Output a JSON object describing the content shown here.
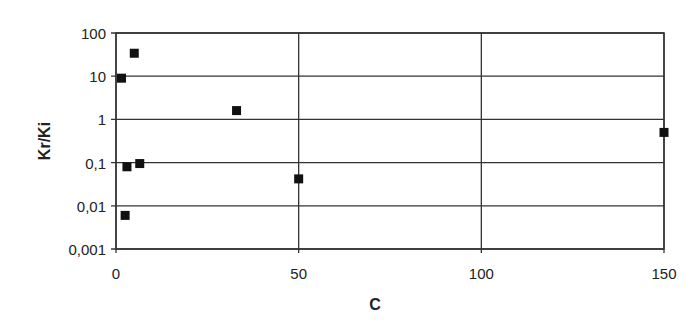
{
  "chart_data": {
    "type": "scatter",
    "title": "",
    "xlabel": "C",
    "ylabel": "Kr/Ki",
    "xlim": [
      0,
      150
    ],
    "ylim": [
      0.001,
      100
    ],
    "yscale": "log",
    "grid": true,
    "legend": null,
    "x_ticks": [
      "0",
      "50",
      "100",
      "150"
    ],
    "y_ticks": [
      "0,001",
      "0,01",
      "0,1",
      "1",
      "10",
      "100"
    ],
    "marker": "square",
    "marker_color": "#111111",
    "series": [
      {
        "name": "Kr/Ki",
        "points": [
          {
            "x": 1.5,
            "y": 9
          },
          {
            "x": 5,
            "y": 34
          },
          {
            "x": 3,
            "y": 0.08
          },
          {
            "x": 6.5,
            "y": 0.095
          },
          {
            "x": 2.5,
            "y": 0.006
          },
          {
            "x": 33,
            "y": 1.6
          },
          {
            "x": 50,
            "y": 0.042
          },
          {
            "x": 150,
            "y": 0.5
          }
        ]
      }
    ]
  }
}
